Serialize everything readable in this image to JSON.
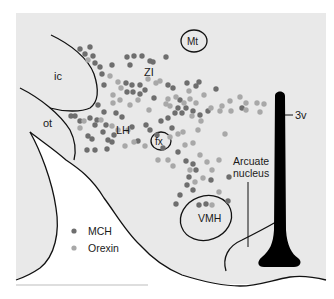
{
  "colors": {
    "panel": "#e9e9e9",
    "white_region": "#ffffff",
    "outline": "#111111",
    "mch": "#6e6e6e",
    "orexin": "#a8a8a8",
    "ventricle": "#000000"
  },
  "labels": {
    "mt": "Mt",
    "zi": "ZI",
    "ic": "ic",
    "ot": "ot",
    "lh": "LH",
    "fx": "fx",
    "third_ventricle": "3v",
    "arcuate_line1": "Arcuate",
    "arcuate_line2": "nucleus",
    "vmh": "VMH"
  },
  "legend": {
    "items": [
      {
        "label": "MCH",
        "type": "mch"
      },
      {
        "label": "Orexin",
        "type": "orexin"
      }
    ]
  },
  "dots": {
    "mch": [
      [
        80,
        49
      ],
      [
        90,
        47
      ],
      [
        85,
        54
      ],
      [
        93,
        56
      ],
      [
        95,
        63
      ],
      [
        100,
        67
      ],
      [
        112,
        65
      ],
      [
        102,
        74
      ],
      [
        104,
        85
      ],
      [
        98,
        105
      ],
      [
        127,
        57
      ],
      [
        134,
        56
      ],
      [
        142,
        56
      ],
      [
        130,
        65
      ],
      [
        150,
        61
      ],
      [
        153,
        62
      ],
      [
        166,
        57
      ],
      [
        126,
        83
      ],
      [
        132,
        85
      ],
      [
        140,
        85
      ],
      [
        127,
        92
      ],
      [
        133,
        92
      ],
      [
        140,
        94
      ],
      [
        145,
        90
      ],
      [
        154,
        98
      ],
      [
        104,
        112
      ],
      [
        97,
        120
      ],
      [
        95,
        125
      ],
      [
        106,
        125
      ],
      [
        103,
        132
      ],
      [
        88,
        136
      ],
      [
        92,
        139
      ],
      [
        108,
        140
      ],
      [
        71,
        116
      ],
      [
        75,
        116
      ],
      [
        80,
        121
      ],
      [
        90,
        118
      ],
      [
        116,
        113
      ],
      [
        122,
        117
      ],
      [
        132,
        127
      ],
      [
        112,
        142
      ],
      [
        87,
        150
      ],
      [
        95,
        150
      ],
      [
        107,
        149
      ],
      [
        114,
        135
      ],
      [
        199,
        82
      ],
      [
        196,
        86
      ],
      [
        187,
        83
      ],
      [
        216,
        89
      ],
      [
        168,
        85
      ],
      [
        173,
        88
      ],
      [
        178,
        108
      ],
      [
        186,
        108
      ],
      [
        193,
        111
      ],
      [
        200,
        115
      ],
      [
        208,
        111
      ],
      [
        175,
        113
      ],
      [
        182,
        113
      ],
      [
        161,
        121
      ],
      [
        168,
        118
      ],
      [
        172,
        128
      ],
      [
        150,
        130
      ],
      [
        157,
        135
      ],
      [
        180,
        100
      ],
      [
        242,
        108
      ],
      [
        146,
        125
      ],
      [
        138,
        141
      ],
      [
        163,
        148
      ],
      [
        178,
        152
      ],
      [
        186,
        161
      ],
      [
        193,
        164
      ],
      [
        196,
        170
      ],
      [
        189,
        177
      ],
      [
        187,
        185
      ],
      [
        193,
        190
      ],
      [
        180,
        195
      ],
      [
        176,
        204
      ],
      [
        199,
        205
      ],
      [
        206,
        204
      ],
      [
        228,
        201
      ],
      [
        229,
        177
      ],
      [
        211,
        180
      ]
    ],
    "orexin": [
      [
        88,
        60
      ],
      [
        110,
        76
      ],
      [
        118,
        82
      ],
      [
        113,
        95
      ],
      [
        121,
        88
      ],
      [
        148,
        79
      ],
      [
        156,
        83
      ],
      [
        160,
        81
      ],
      [
        138,
        100
      ],
      [
        130,
        105
      ],
      [
        149,
        110
      ],
      [
        120,
        100
      ],
      [
        113,
        103
      ],
      [
        80,
        128
      ],
      [
        84,
        121
      ],
      [
        101,
        120
      ],
      [
        112,
        126
      ],
      [
        118,
        130
      ],
      [
        128,
        130
      ],
      [
        125,
        146
      ],
      [
        134,
        142
      ],
      [
        145,
        146
      ],
      [
        168,
        99
      ],
      [
        166,
        104
      ],
      [
        176,
        97
      ],
      [
        190,
        99
      ],
      [
        184,
        103
      ],
      [
        196,
        103
      ],
      [
        204,
        95
      ],
      [
        189,
        91
      ],
      [
        170,
        106
      ],
      [
        192,
        116
      ],
      [
        201,
        121
      ],
      [
        211,
        108
      ],
      [
        220,
        111
      ],
      [
        230,
        101
      ],
      [
        240,
        97
      ],
      [
        246,
        103
      ],
      [
        222,
        106
      ],
      [
        231,
        111
      ],
      [
        246,
        110
      ],
      [
        257,
        103
      ],
      [
        260,
        112
      ],
      [
        264,
        104
      ],
      [
        198,
        130
      ],
      [
        170,
        137
      ],
      [
        178,
        134
      ],
      [
        183,
        132
      ],
      [
        185,
        145
      ],
      [
        193,
        143
      ],
      [
        200,
        155
      ],
      [
        207,
        162
      ],
      [
        212,
        170
      ],
      [
        190,
        170
      ],
      [
        203,
        178
      ],
      [
        195,
        182
      ],
      [
        168,
        160
      ],
      [
        173,
        166
      ],
      [
        158,
        160
      ],
      [
        219,
        160
      ],
      [
        219,
        192
      ],
      [
        212,
        205
      ],
      [
        225,
        134
      ]
    ]
  }
}
